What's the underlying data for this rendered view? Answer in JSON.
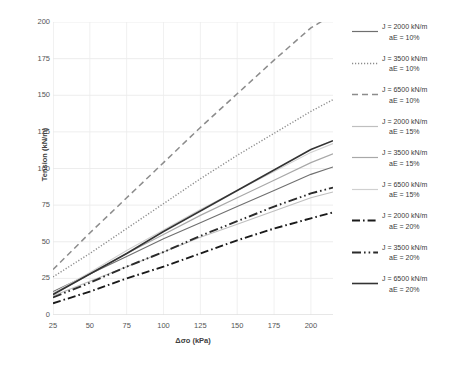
{
  "chart_data": {
    "type": "line",
    "title": "",
    "xlabel": "Δσo (kPa)",
    "ylabel": "Tension (kN/m)",
    "xlim": [
      25,
      215
    ],
    "ylim": [
      0,
      200
    ],
    "xticks": [
      25,
      50,
      75,
      100,
      125,
      150,
      175,
      200
    ],
    "yticks": [
      0,
      25,
      50,
      75,
      100,
      125,
      150,
      175,
      200
    ],
    "grid": true,
    "legend_position": "right",
    "x": [
      25,
      50,
      75,
      100,
      125,
      150,
      175,
      200,
      215
    ],
    "series": [
      {
        "name": "J = 2000 kN/m aE = 10%",
        "label_line1": "J = 2000 kN/m",
        "label_line2": "aE = 10%",
        "J": 2000,
        "aE": "10%",
        "style": "solid",
        "color": "#6f6f6f",
        "width": 1.1,
        "values": [
          16,
          28,
          40,
          52,
          63,
          74,
          85,
          96,
          101
        ]
      },
      {
        "name": "J = 3500 kN/m aE = 10%",
        "label_line1": "J = 3500 kN/m",
        "label_line2": "aE = 10%",
        "J": 3500,
        "aE": "10%",
        "style": "dotted",
        "color": "#8c8c8c",
        "width": 1.4,
        "values": [
          26,
          42,
          59,
          76,
          93,
          109,
          124,
          139,
          147
        ]
      },
      {
        "name": "J = 6500 kN/m aE = 10%",
        "label_line1": "J = 6500 kN/m",
        "label_line2": "aE = 10%",
        "J": 6500,
        "aE": "10%",
        "style": "dashed",
        "color": "#8c8c8c",
        "width": 1.5,
        "values": [
          31,
          56,
          80,
          104,
          128,
          151,
          174,
          196,
          205
        ]
      },
      {
        "name": "J = 2000 kN/m aE = 15%",
        "label_line1": "J = 2000 kN/m",
        "label_line2": "aE = 15%",
        "J": 2000,
        "aE": "15%",
        "style": "solid-light",
        "color": "#bfbfbf",
        "width": 1.1,
        "values": [
          13,
          23,
          33,
          43,
          53,
          62,
          71,
          80,
          84
        ]
      },
      {
        "name": "J = 3500 kN/m aE = 15%",
        "label_line1": "J = 3500 kN/m",
        "label_line2": "aE = 15%",
        "J": 3500,
        "aE": "15%",
        "style": "solid-light2",
        "color": "#a8a8a8",
        "width": 1.2,
        "values": [
          14,
          28,
          42,
          55,
          68,
          80,
          92,
          104,
          110
        ]
      },
      {
        "name": "J = 6500 kN/m aE = 15%",
        "label_line1": "J = 6500 kN/m",
        "label_line2": "aE = 15%",
        "J": 6500,
        "aE": "15%",
        "style": "solid-light3",
        "color": "#d0d0d0",
        "width": 1.1,
        "values": [
          15,
          29,
          44,
          58,
          72,
          85,
          98,
          111,
          117
        ]
      },
      {
        "name": "J = 2000 kN/m aE = 20%",
        "label_line1": "J = 2000 kN/m",
        "label_line2": "aE = 20%",
        "J": 2000,
        "aE": "20%",
        "style": "dashdot",
        "color": "#1a1a1a",
        "width": 1.9,
        "values": [
          8,
          16,
          25,
          33,
          42,
          51,
          59,
          66,
          70
        ]
      },
      {
        "name": "J = 3500 kN/m aE = 20%",
        "label_line1": "J = 3500 kN/m",
        "label_line2": "aE = 20%",
        "J": 3500,
        "aE": "20%",
        "style": "dashdotdot",
        "color": "#2b2b2b",
        "width": 1.9,
        "values": [
          12,
          22,
          33,
          43,
          54,
          64,
          74,
          83,
          87
        ]
      },
      {
        "name": "J = 6500 kN/m aE = 20%",
        "label_line1": "J = 6500 kN/m",
        "label_line2": "aE = 20%",
        "J": 6500,
        "aE": "20%",
        "style": "solid-dark",
        "color": "#333333",
        "width": 1.6,
        "values": [
          14,
          28,
          42,
          57,
          71,
          85,
          99,
          113,
          119
        ]
      }
    ]
  },
  "axes": {
    "y_title": "Tension (kN/m)",
    "x_title": "Δσo (kPa)"
  }
}
